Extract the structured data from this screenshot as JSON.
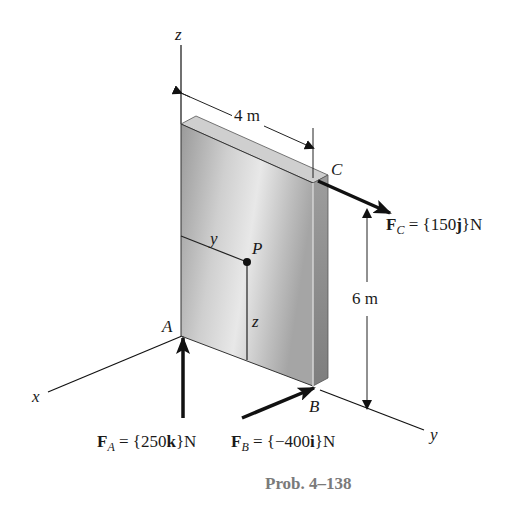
{
  "figure": {
    "caption": "Prob. 4–138",
    "axes": {
      "x": "x",
      "y": "y",
      "z": "z"
    },
    "points": {
      "A": "A",
      "B": "B",
      "C": "C",
      "P": "P"
    },
    "coords_on_plate": {
      "y": "y",
      "z": "z"
    },
    "dimensions": {
      "width": "4 m",
      "height": "6 m"
    },
    "forces": {
      "FA": {
        "symbol": "F",
        "subscript": "A",
        "eq": " = {250",
        "unit_vec": "k",
        "close": "}N"
      },
      "FB": {
        "symbol": "F",
        "subscript": "B",
        "eq": " = {−400",
        "unit_vec": "i",
        "close": "}N"
      },
      "FC": {
        "symbol": "F",
        "subscript": "C",
        "eq": " = {150",
        "unit_vec": "j",
        "close": "}N"
      }
    },
    "colors": {
      "caption": "#7a7a7a",
      "plate_light": "#e6e6e6",
      "plate_dark": "#8a8a8a",
      "ink": "#111111"
    }
  }
}
